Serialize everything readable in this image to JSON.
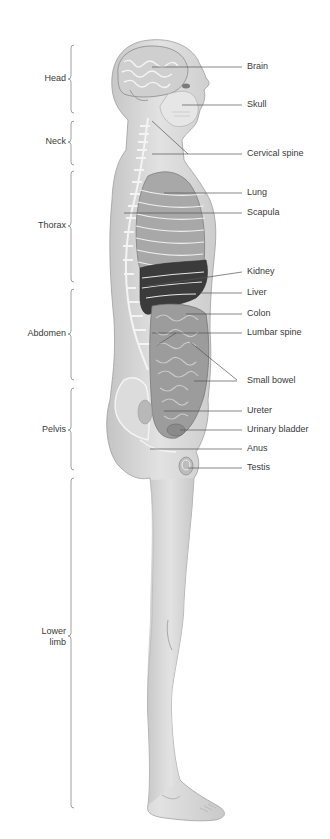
{
  "diagram": {
    "regions": [
      {
        "label": "Head",
        "top": 45,
        "bottom": 113,
        "label_y": 79
      },
      {
        "label": "Neck",
        "top": 121,
        "bottom": 165,
        "label_y": 142
      },
      {
        "label": "Thorax",
        "top": 171,
        "bottom": 282,
        "label_y": 226
      },
      {
        "label": "Abdomen",
        "top": 289,
        "bottom": 380,
        "label_y": 334
      },
      {
        "label": "Pelvis",
        "top": 388,
        "bottom": 470,
        "label_y": 430
      },
      {
        "label": "Lower\nlimb",
        "line1": "Lower",
        "line2": "limb",
        "top": 478,
        "bottom": 808,
        "label_y": 636
      }
    ],
    "parts": [
      {
        "label": "Brain",
        "y": 67
      },
      {
        "label": "Skull",
        "y": 104
      },
      {
        "label": "Cervical spine",
        "y": 154
      },
      {
        "label": "Lung",
        "y": 193
      },
      {
        "label": "Scapula",
        "y": 213
      },
      {
        "label": "Kidney",
        "y": 272
      },
      {
        "label": "Liver",
        "y": 293
      },
      {
        "label": "Colon",
        "y": 313
      },
      {
        "label": "Lumbar spine",
        "y": 333
      },
      {
        "label": "Small bowel",
        "y": 380
      },
      {
        "label": "Ureter",
        "y": 411
      },
      {
        "label": "Urinary bladder",
        "y": 430
      },
      {
        "label": "Anus",
        "y": 449
      },
      {
        "label": "Testis",
        "y": 468
      }
    ],
    "colors": {
      "skin": "#d9d9d9",
      "skin_shadow": "#bdbdbd",
      "bone": "#f2f2f2",
      "organ_dark": "#3a3a3a",
      "organ_mid": "#8a8a8a",
      "leader_line": "#555555",
      "bracket": "#888888",
      "text": "#3a3a3a"
    }
  }
}
